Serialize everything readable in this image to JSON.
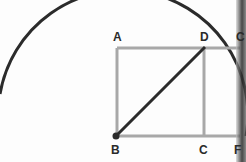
{
  "diagram": {
    "points": {
      "A": {
        "label": "A",
        "x": 117,
        "y": 48
      },
      "B": {
        "label": "B",
        "x": 116,
        "y": 136
      },
      "C": {
        "label": "C",
        "x": 204,
        "y": 136
      },
      "D": {
        "label": "D",
        "x": 204,
        "y": 48
      },
      "E": {
        "label": "C",
        "x": 237,
        "y": 48
      },
      "F": {
        "label": "F",
        "x": 237,
        "y": 136
      }
    },
    "arc": {
      "center": "B",
      "radius": 123,
      "color": "#2b2b2b"
    },
    "segments": [
      {
        "from": "A",
        "to": "B",
        "color": "#a8a8a8"
      },
      {
        "from": "A",
        "to": "E",
        "color": "#a8a8a8"
      },
      {
        "from": "B",
        "to": "F",
        "color": "#a8a8a8"
      },
      {
        "from": "D",
        "to": "C",
        "color": "#a8a8a8"
      },
      {
        "from": "B",
        "to": "D",
        "color": "#2b2b2b"
      }
    ],
    "colors": {
      "arc": "#2b2b2b",
      "square": "#a8a8a8",
      "diagonal": "#2b2b2b",
      "label": "#2a2a2a"
    }
  }
}
